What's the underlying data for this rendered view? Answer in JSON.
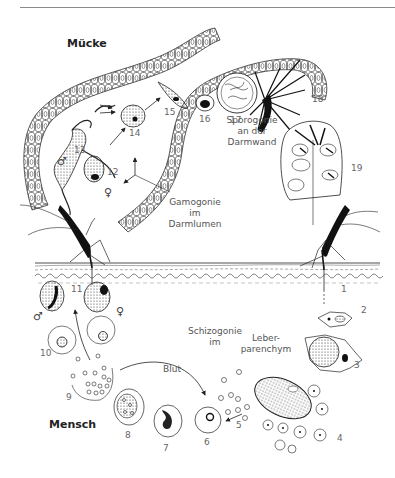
{
  "hosts": {
    "mosquito": "Mücke",
    "human": "Mensch"
  },
  "labels": {
    "sporogony": [
      "Sporogonie",
      "an der",
      "Darmwand"
    ],
    "gamogony": [
      "Gamogonie",
      "im",
      "Darmlumen"
    ],
    "schizogony": [
      "Schizogonie",
      "im"
    ],
    "blood": "Blut",
    "liver": [
      "Leber-",
      "parenchym"
    ]
  },
  "stage_numbers": [
    "1",
    "2",
    "3",
    "4",
    "5",
    "6",
    "7",
    "8",
    "9",
    "10",
    "11",
    "12",
    "13",
    "14",
    "15",
    "16",
    "17",
    "18",
    "19"
  ],
  "symbols": {
    "male": "♂",
    "female": "♀"
  },
  "colors": {
    "line": "#222222",
    "text": "#555555",
    "rule": "#8a8a8a"
  }
}
